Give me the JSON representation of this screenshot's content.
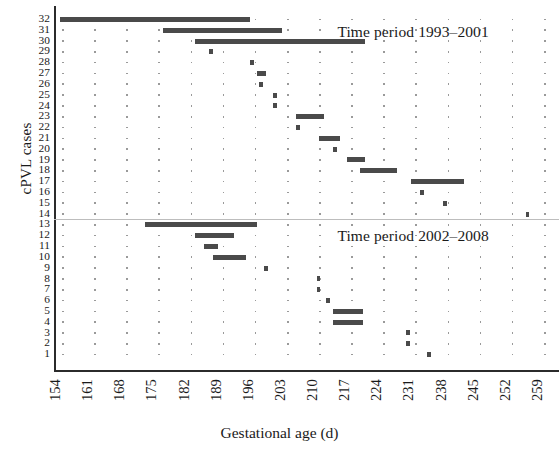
{
  "chart_data": {
    "type": "bar",
    "orientation": "horizontal",
    "title": "",
    "xlabel": "Gestational age (d)",
    "ylabel": "cPVL cases",
    "xlim": [
      154,
      259
    ],
    "ylim": [
      1,
      32
    ],
    "xticks": [
      154,
      161,
      168,
      175,
      182,
      189,
      196,
      203,
      210,
      217,
      224,
      231,
      238,
      245,
      252,
      259
    ],
    "yticks": [
      1,
      2,
      3,
      4,
      5,
      6,
      7,
      8,
      9,
      10,
      11,
      12,
      13,
      14,
      15,
      16,
      17,
      18,
      19,
      20,
      21,
      22,
      23,
      24,
      25,
      26,
      27,
      28,
      29,
      30,
      31,
      32
    ],
    "grid": "vertical dotted",
    "legend": "none",
    "annotations": [
      {
        "text": "Time period 1993–2001",
        "case_ref": 31,
        "x_day": 214
      },
      {
        "text": "Time period 2002–2008",
        "case_ref": 12,
        "x_day": 214
      }
    ],
    "separator": {
      "between_cases": [
        13,
        14
      ],
      "style": "thin grey line"
    },
    "series": [
      {
        "name": "Time period 1993–2001",
        "cases": [
          {
            "case": 32,
            "start": 153.5,
            "end": 195.0
          },
          {
            "case": 31,
            "start": 176.0,
            "end": 202.0
          },
          {
            "case": 30,
            "start": 183.0,
            "end": 220.0
          },
          {
            "case": 29,
            "start": 186.0,
            "end": 186.8
          },
          {
            "case": 28,
            "start": 195.0,
            "end": 195.8
          },
          {
            "case": 27,
            "start": 196.5,
            "end": 198.5
          },
          {
            "case": 26,
            "start": 197.0,
            "end": 197.8
          },
          {
            "case": 25,
            "start": 200.0,
            "end": 200.8
          },
          {
            "case": 24,
            "start": 200.0,
            "end": 200.8
          },
          {
            "case": 23,
            "start": 205.0,
            "end": 211.0
          },
          {
            "case": 22,
            "start": 205.0,
            "end": 205.8
          },
          {
            "case": 21,
            "start": 210.0,
            "end": 214.5
          },
          {
            "case": 20,
            "start": 213.0,
            "end": 213.8
          },
          {
            "case": 19,
            "start": 216.0,
            "end": 220.0
          },
          {
            "case": 18,
            "start": 219.0,
            "end": 227.0
          },
          {
            "case": 17,
            "start": 230.0,
            "end": 241.5
          },
          {
            "case": 16,
            "start": 232.0,
            "end": 232.8
          },
          {
            "case": 15,
            "start": 237.0,
            "end": 237.8
          }
        ]
      },
      {
        "name": "Time period 2002–2008",
        "cases": [
          {
            "case": 14,
            "start": 255.0,
            "end": 255.8
          },
          {
            "case": 13,
            "start": 172.0,
            "end": 196.5
          },
          {
            "case": 12,
            "start": 183.0,
            "end": 191.5
          },
          {
            "case": 11,
            "start": 185.0,
            "end": 188.0
          },
          {
            "case": 10,
            "start": 187.0,
            "end": 194.0
          },
          {
            "case": 9,
            "start": 198.0,
            "end": 198.8
          },
          {
            "case": 8,
            "start": 209.5,
            "end": 210.3
          },
          {
            "case": 7,
            "start": 209.5,
            "end": 210.3
          },
          {
            "case": 6,
            "start": 211.5,
            "end": 212.3
          },
          {
            "case": 5,
            "start": 213.0,
            "end": 219.5
          },
          {
            "case": 4,
            "start": 213.0,
            "end": 219.5
          },
          {
            "case": 3,
            "start": 229.0,
            "end": 229.8
          },
          {
            "case": 2,
            "start": 229.0,
            "end": 229.8
          },
          {
            "case": 1,
            "start": 233.5,
            "end": 234.3
          }
        ]
      }
    ]
  },
  "axes": {
    "y_title": "cPVL cases",
    "x_title": "Gestational age (d)",
    "x_tick_labels": [
      "154",
      "161",
      "168",
      "175",
      "182",
      "189",
      "196",
      "203",
      "210",
      "217",
      "224",
      "231",
      "238",
      "245",
      "252",
      "259"
    ],
    "y_tick_labels": [
      "32",
      "31",
      "30",
      "29",
      "28",
      "27",
      "26",
      "25",
      "24",
      "23",
      "22",
      "21",
      "20",
      "19",
      "18",
      "17",
      "16",
      "15",
      "14",
      "13",
      "12",
      "11",
      "10",
      "9",
      "8",
      "7",
      "6",
      "5",
      "4",
      "3",
      "2",
      "1"
    ]
  },
  "annotations": {
    "top_period": "Time period 1993–2001",
    "bottom_period": "Time period 2002–2008"
  },
  "colors": {
    "bar": "#4a4a4a",
    "axis": "#2b2b2b",
    "grid_dot": "#9a9a9a",
    "separator": "#bdbdbd",
    "text": "#1a1a1a",
    "background": "#ffffff"
  }
}
